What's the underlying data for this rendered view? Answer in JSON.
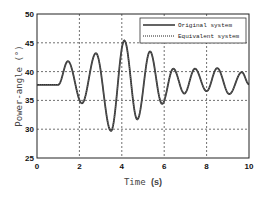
{
  "chart_data": {
    "type": "line",
    "title": "",
    "xlabel": "Time (s)",
    "ylabel": "Power-angle (°)",
    "xlim": [
      0,
      10
    ],
    "ylim": [
      25,
      50
    ],
    "xticks": [
      0,
      2,
      4,
      6,
      8,
      10
    ],
    "yticks": [
      25,
      30,
      35,
      40,
      45,
      50
    ],
    "grid": true,
    "legend_position": "upper right",
    "series": [
      {
        "name": "Original system",
        "style": "solid",
        "x": [
          0,
          1.0,
          1.46,
          2.12,
          2.78,
          3.49,
          4.12,
          4.73,
          5.33,
          5.9,
          6.43,
          6.95,
          7.45,
          8.0,
          8.5,
          9.07,
          9.66,
          10.0
        ],
        "y": [
          37.7,
          37.7,
          41.8,
          34.5,
          43.2,
          29.7,
          45.4,
          31.7,
          43.5,
          34.4,
          40.5,
          36.2,
          40.5,
          36.6,
          40.6,
          36.1,
          39.9,
          37.8
        ]
      },
      {
        "name": "Equivalent system",
        "style": "dotted",
        "x": [
          0,
          1.0,
          1.46,
          2.12,
          2.78,
          3.49,
          4.12,
          4.73,
          5.33,
          5.9,
          6.43,
          6.95,
          7.45,
          8.0,
          8.5,
          9.07,
          9.66,
          10.0
        ],
        "y": [
          37.7,
          37.7,
          41.8,
          34.5,
          43.2,
          29.7,
          45.4,
          31.7,
          43.5,
          34.4,
          40.5,
          36.2,
          40.5,
          36.6,
          40.6,
          36.1,
          39.9,
          37.8
        ]
      }
    ]
  },
  "legend": {
    "items": [
      {
        "label": "Original system"
      },
      {
        "label": "Equivalent system"
      }
    ]
  },
  "axes": {
    "xlabel_main": "Time ",
    "xlabel_unit": "(s)",
    "ylabel": "Power-angle (°)"
  }
}
